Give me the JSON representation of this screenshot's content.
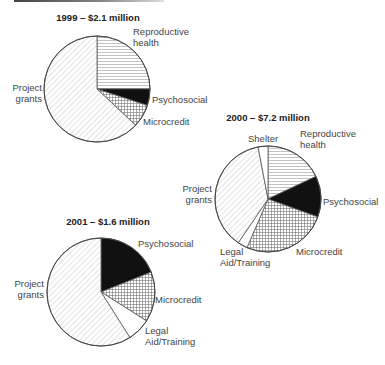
{
  "chart_data": [
    {
      "type": "pie",
      "title": "1999 – $2.1 million",
      "center": [
        97,
        89
      ],
      "radius": 53,
      "slices": [
        {
          "label": "Reproductive health",
          "value": 25,
          "pattern": "hlines"
        },
        {
          "label": "Psychosocial",
          "value": 5,
          "pattern": "solid"
        },
        {
          "label": "Microcredit",
          "value": 7,
          "pattern": "grid"
        },
        {
          "label": "Project grants",
          "value": 63,
          "pattern": "diag"
        }
      ],
      "labels": [
        {
          "lines": [
            "Reproductive",
            "health"
          ],
          "x": 133,
          "y": 35,
          "anchor": "start"
        },
        {
          "lines": [
            "Psychosocial"
          ],
          "x": 152,
          "y": 103,
          "anchor": "start"
        },
        {
          "lines": [
            "Microcredit"
          ],
          "x": 143,
          "y": 125,
          "anchor": "start"
        },
        {
          "lines": [
            "Project",
            "grants"
          ],
          "x": 42,
          "y": 91,
          "anchor": "end"
        }
      ],
      "title_pos": [
        98,
        21
      ]
    },
    {
      "type": "pie",
      "title": "2000 – $7.2 million",
      "center": [
        268,
        199
      ],
      "radius": 53,
      "slices": [
        {
          "label": "Reproductive health",
          "value": 18,
          "pattern": "hlines"
        },
        {
          "label": "Psychosocial",
          "value": 12.5,
          "pattern": "solid"
        },
        {
          "label": "Microcredit",
          "value": 26,
          "pattern": "grid"
        },
        {
          "label": "Legal Aid/Training",
          "value": 3,
          "pattern": "none"
        },
        {
          "label": "Project grants",
          "value": 37.5,
          "pattern": "diag"
        },
        {
          "label": "Shelter",
          "value": 3,
          "pattern": "none"
        }
      ],
      "labels": [
        {
          "lines": [
            "Shelter"
          ],
          "x": 248,
          "y": 142,
          "anchor": "start"
        },
        {
          "lines": [
            "Reproductive",
            "health"
          ],
          "x": 300,
          "y": 137,
          "anchor": "start"
        },
        {
          "lines": [
            "Psychosocial"
          ],
          "x": 323,
          "y": 205,
          "anchor": "start"
        },
        {
          "lines": [
            "Microcredit"
          ],
          "x": 296,
          "y": 255,
          "anchor": "start"
        },
        {
          "lines": [
            "Legal",
            "Aid/Training"
          ],
          "x": 220,
          "y": 255,
          "anchor": "start"
        },
        {
          "lines": [
            "Project",
            "grants"
          ],
          "x": 212,
          "y": 192,
          "anchor": "end"
        }
      ],
      "title_pos": [
        268,
        121
      ]
    },
    {
      "type": "pie",
      "title": "2001 – $1.6 million",
      "center": [
        101,
        292
      ],
      "radius": 54,
      "slices": [
        {
          "label": "Psychosocial",
          "value": 19,
          "pattern": "solid"
        },
        {
          "label": "Microcredit",
          "value": 15,
          "pattern": "grid"
        },
        {
          "label": "Legal Aid/Training",
          "value": 7,
          "pattern": "none"
        },
        {
          "label": "Project grants",
          "value": 59,
          "pattern": "diag"
        }
      ],
      "labels": [
        {
          "lines": [
            "Psychosocial"
          ],
          "x": 138,
          "y": 247,
          "anchor": "start"
        },
        {
          "lines": [
            "Microcredit"
          ],
          "x": 155,
          "y": 303,
          "anchor": "start"
        },
        {
          "lines": [
            "Legal",
            "Aid/Training"
          ],
          "x": 145,
          "y": 334,
          "anchor": "start"
        },
        {
          "lines": [
            "Project",
            "grants"
          ],
          "x": 44,
          "y": 287,
          "anchor": "end"
        }
      ],
      "title_pos": [
        108,
        225
      ]
    }
  ]
}
